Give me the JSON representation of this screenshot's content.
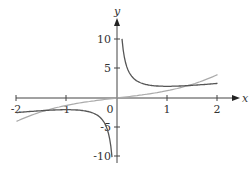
{
  "chart_data": {
    "type": "line",
    "title": "",
    "xlabel": "x",
    "ylabel": "y",
    "xlim": [
      -2,
      2
    ],
    "ylim": [
      -10,
      10
    ],
    "grid": false,
    "legend": null,
    "x_ticks": [
      "-2",
      "-1",
      "0",
      "1",
      "2"
    ],
    "y_ticks": [
      "10",
      "5",
      "-5",
      "-10"
    ],
    "origin_label": "0",
    "series": [
      {
        "name": "dark curve (hyperbola-like, y = x + 1/x)",
        "color": "#555555",
        "branches": [
          {
            "x": [
              0.1,
              0.15,
              0.2,
              0.3,
              0.5,
              0.75,
              1,
              1.5,
              2
            ],
            "y": [
              10.1,
              6.82,
              5.2,
              3.63,
              2.5,
              2.08,
              2.0,
              2.17,
              2.5
            ]
          },
          {
            "x": [
              -2,
              -1.5,
              -1,
              -0.75,
              -0.5,
              -0.3,
              -0.2,
              -0.15,
              -0.1
            ],
            "y": [
              -2.5,
              -2.17,
              -2.0,
              -2.08,
              -2.5,
              -3.63,
              -5.2,
              -6.82,
              -10.1
            ]
          }
        ]
      },
      {
        "name": "light curve (cubic-like through origin)",
        "color": "#aaaaaa",
        "x": [
          -2,
          -1.5,
          -1,
          -0.5,
          0,
          0.5,
          1,
          1.5,
          2
        ],
        "y": [
          -4.0,
          -2.34,
          -1.25,
          -0.53,
          0,
          0.53,
          1.25,
          2.34,
          4.0
        ]
      }
    ]
  },
  "labels": {
    "x_axis": "x",
    "y_axis": "y",
    "origin": "0",
    "x_ticks": [
      "-2",
      "-1",
      "1",
      "2"
    ],
    "y_ticks": [
      "10",
      "5",
      "-5",
      "-10"
    ]
  }
}
